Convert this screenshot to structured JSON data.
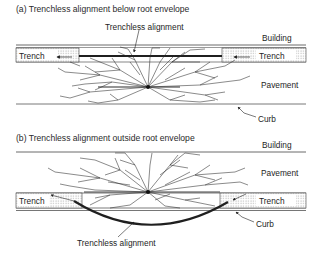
{
  "panels": [
    {
      "caption": "(a) Trenchless alignment below root envelope",
      "labels": {
        "alignment": "Trenchless alignment",
        "building": "Building",
        "trench_left": "Trench",
        "trench_right": "Trench",
        "pavement": "Pavement",
        "curb": "Curb"
      }
    },
    {
      "caption": "(b) Trenchless alignment outside root envelope",
      "labels": {
        "building": "Building",
        "pavement": "Pavement",
        "trench_left": "Trench",
        "trench_right": "Trench",
        "curb": "Curb",
        "alignment": "Trenchless alignment"
      }
    }
  ],
  "colors": {
    "line": "#333333",
    "pipe": "#222222",
    "root": "#2b2b2b",
    "trench_fill": "#e8e8e8"
  }
}
